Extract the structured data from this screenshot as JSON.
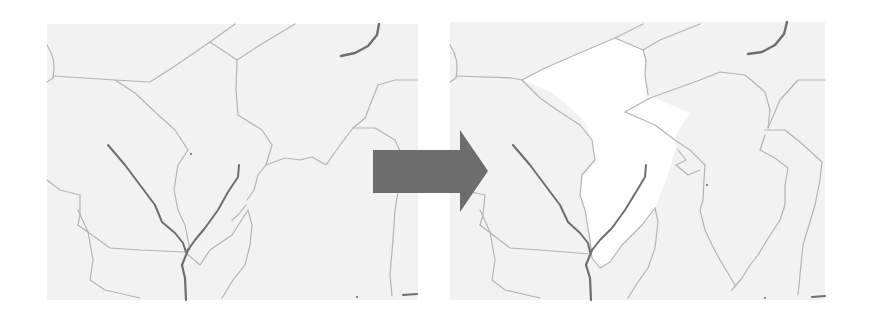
{
  "diagram": {
    "type": "before-after-map-comparison",
    "background": "#ffffff",
    "map_fill": "#f2f2f2",
    "highlight_fill": "#ffffff",
    "boundary_color": "#b4b4b4",
    "river_color": "#6e6e6e",
    "arrow_color": "#6d6d6d"
  },
  "arrow": {
    "label": "",
    "points": "373,150 460,150 460,130 488,171 460,212 460,193 373,193"
  },
  "left_map": {
    "name": "before",
    "rect": {
      "x": 47,
      "y": 24,
      "w": 371,
      "h": 276
    },
    "highlight": null,
    "boundaries": [
      "M47,45 Q57,60 53,78 L47,82",
      "M53,76 L115,80 L150,82 L175,66 L210,42 L235,24",
      "M210,42 L237,60 L236,90 L238,115 L262,130 L272,145 L266,165 L258,175 L254,190 L247,200",
      "M237,60 L260,45 L295,24",
      "M115,80 L135,93 L155,112 L175,130 L188,150 L178,165 L174,190 L178,210 L185,225 L190,250",
      "M266,165 L285,158 L300,160 L312,157 L326,165 L340,145 L353,128 L365,118 L378,85 L395,80 L417,80",
      "M353,128 L375,128 L395,140 L404,160 L400,180 L395,210 L393,240 L390,275 L392,296",
      "M47,180 L60,190 L80,195 L80,215 L78,225",
      "M78,210 L88,232 L93,260 L90,280 L105,290 L140,298",
      "M78,225 L110,248 L140,250 L185,252",
      "M185,252 L200,265 L210,250 L232,235 L248,210",
      "M248,210 L252,225 L250,245 L245,265 L233,280 L222,298",
      "M246,205 L238,215 L232,220"
    ],
    "rivers": [
      {
        "d": "M108,145 L125,165 L140,185 L155,205 L162,222 L175,233 L183,243 L186,252",
        "width": 2
      },
      {
        "d": "M239,165 L238,177 L228,192 L218,210 L205,228 L195,240 L188,250",
        "width": 2
      },
      {
        "d": "M188,250 L182,265 L185,278 L186,300",
        "width": 2.2
      },
      {
        "d": "M341,56 L355,53 L368,46 L377,35 L379,24",
        "width": 2.4
      },
      {
        "d": "M403,295 L417,294",
        "width": 2
      }
    ],
    "dots": [
      {
        "x": 191,
        "y": 154
      },
      {
        "x": 357,
        "y": 297
      }
    ]
  },
  "right_map": {
    "name": "after",
    "rect": {
      "x": 450,
      "y": 22,
      "w": 375,
      "h": 278
    },
    "highlight": "M522,80 L545,68 L582,52 L615,38 L643,50 L646,60 L645,75 L648,95 L690,113 L676,135 L676,148 L672,160 L668,175 L660,195 L655,208 L642,225 L622,245 L610,262 L600,268 L592,258 L590,240 L585,210 L580,195 L582,175 L595,160 L592,140 L585,122 L570,108 L553,93 Z",
    "boundaries": [
      "M450,45 Q460,60 456,78 L450,82",
      "M456,76 L512,78 L522,80",
      "M522,80 L545,68 L582,52 L615,38 L643,24",
      "M615,38 L643,50 L646,60 L645,75 L648,95",
      "M643,50 L660,40 L700,24",
      "M522,80 L540,98 L560,112 L580,125 L592,140 L595,160 L582,175 L580,195 L585,210 L590,240 L592,258",
      "M625,112 L650,98 L700,80 L720,72 L745,75 L765,92 L770,110 L768,128",
      "M625,112 L655,125 L675,140 L690,150 L705,165 L704,180",
      "M768,128 L780,100 L798,80 L825,80",
      "M765,130 L785,130 L800,142 L822,162 L820,180 L815,205 L803,245 L800,275 L798,295",
      "M765,135 L760,150 L775,158 L788,168 L785,185 L785,205 L780,220 L767,240 L758,255 L750,265 L742,278 L732,290",
      "M704,180 L703,200 L700,210 L705,230 L712,245 L720,260 L735,285",
      "M678,150 L686,160 L676,165 L688,175 L700,170",
      "M450,180 L462,190 L485,195 L483,215 L480,225",
      "M480,210 L490,232 L495,260 L492,280 L505,290 L540,298",
      "M480,225 L510,248 L540,250 L590,254",
      "M592,258 L600,268 L610,262 L622,245 L642,225 L655,208",
      "M655,208 L658,222 L655,248 L648,268 L636,285 L628,298"
    ],
    "rivers": [
      {
        "d": "M513,145 L530,165 L545,185 L560,205 L568,222 L580,233 L588,243 L590,252",
        "width": 2
      },
      {
        "d": "M646,165 L645,177 L636,192 L625,210 L612,228 L600,240 L592,250",
        "width": 2
      },
      {
        "d": "M592,250 L586,265 L590,278 L591,300",
        "width": 2.2
      },
      {
        "d": "M748,54 L762,52 L775,45 L784,34 L787,22",
        "width": 2.4
      },
      {
        "d": "M812,297 L825,296",
        "width": 2
      }
    ],
    "dots": [
      {
        "x": 707,
        "y": 185
      },
      {
        "x": 765,
        "y": 298
      }
    ]
  }
}
